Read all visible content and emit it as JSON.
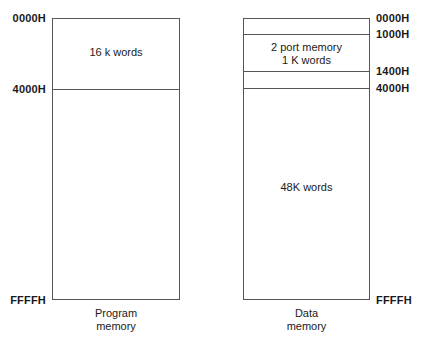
{
  "figure": {
    "type": "memory-map-diagram",
    "background_color": "#ffffff",
    "line_color": "#555555",
    "text_color": "#1a1a1a"
  },
  "program_memory": {
    "caption_line1": "Program",
    "caption_line2": "memory",
    "addresses": [
      {
        "label": "0000H",
        "position": "top"
      },
      {
        "label": "4000H",
        "position": "divider"
      },
      {
        "label": "FFFFH",
        "position": "bottom"
      }
    ],
    "regions": [
      {
        "label": "16 k words",
        "from": "0000H",
        "to": "4000H"
      },
      {
        "label": "",
        "from": "4000H",
        "to": "FFFFH"
      }
    ]
  },
  "data_memory": {
    "caption_line1": "Data",
    "caption_line2": "memory",
    "addresses": [
      {
        "label": "0000H",
        "position": "top"
      },
      {
        "label": "1000H",
        "position": "divider"
      },
      {
        "label": "1400H",
        "position": "divider"
      },
      {
        "label": "4000H",
        "position": "divider"
      },
      {
        "label": "FFFFH",
        "position": "bottom"
      }
    ],
    "regions": [
      {
        "label": "",
        "from": "0000H",
        "to": "1000H"
      },
      {
        "label_line1": "2 port memory",
        "label_line2": "1 K words",
        "from": "1000H",
        "to": "1400H"
      },
      {
        "label": "",
        "from": "1400H",
        "to": "4000H"
      },
      {
        "label": "48K words",
        "from": "4000H",
        "to": "FFFFH"
      }
    ]
  }
}
